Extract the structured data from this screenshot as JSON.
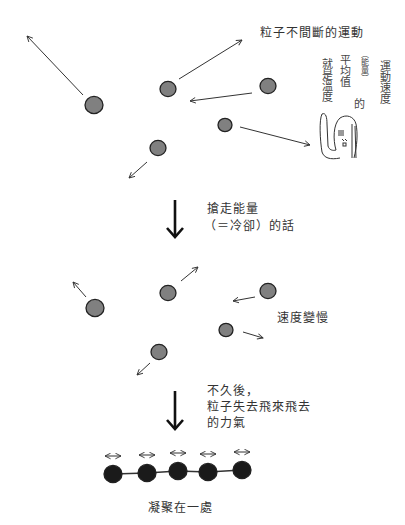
{
  "title": "粒子不間斷的運動",
  "sections": {
    "moving": {
      "label": "粒子不間斷的運動",
      "particles": [
        {
          "cx": 94,
          "cy": 105,
          "r": 9,
          "arrow": [
            83,
            95,
            27,
            36
          ]
        },
        {
          "cx": 168,
          "cy": 89,
          "r": 8,
          "arrow": [
            179,
            79,
            242,
            40
          ]
        },
        {
          "cx": 268,
          "cy": 86,
          "r": 8,
          "arrow": [
            252,
            93,
            190,
            101
          ]
        },
        {
          "cx": 225,
          "cy": 125,
          "r": 7,
          "arrow": [
            240,
            127,
            310,
            145
          ]
        },
        {
          "cx": 158,
          "cy": 148,
          "r": 8,
          "arrow": [
            147,
            162,
            129,
            178
          ]
        }
      ],
      "particle_color": "#808080"
    },
    "step1": {
      "arrow_label_line1": "搶走能量",
      "arrow_label_line2": "（＝冷卻）的話"
    },
    "slowing": {
      "label": "速度變慢",
      "particles": [
        {
          "cx": 95,
          "cy": 308,
          "r": 9,
          "arrow": [
            86,
            297,
            73,
            282
          ]
        },
        {
          "cx": 168,
          "cy": 293,
          "r": 8,
          "arrow": [
            181,
            281,
            198,
            267
          ]
        },
        {
          "cx": 268,
          "cy": 291,
          "r": 8,
          "arrow": [
            255,
            297,
            233,
            301
          ]
        },
        {
          "cx": 226,
          "cy": 330,
          "r": 7,
          "arrow": [
            243,
            332,
            263,
            338
          ]
        },
        {
          "cx": 159,
          "cy": 352,
          "r": 8,
          "arrow": [
            150,
            363,
            137,
            375
          ]
        }
      ],
      "particle_color": "#808080"
    },
    "step2": {
      "arrow_label_line1": "不久後，",
      "arrow_label_line2": "粒子失去飛來飛去",
      "arrow_label_line3": "的力氣"
    },
    "condensed": {
      "label": "凝聚在一處",
      "particles": [
        {
          "cx": 113,
          "cy": 474,
          "r": 9
        },
        {
          "cx": 147,
          "cy": 473,
          "r": 9
        },
        {
          "cx": 178,
          "cy": 471,
          "r": 9
        },
        {
          "cx": 208,
          "cy": 472,
          "r": 9
        },
        {
          "cx": 242,
          "cy": 470,
          "r": 9
        }
      ],
      "particle_color": "#1a1a1a"
    }
  },
  "annotation": {
    "columns": [
      "運動速度",
      "的",
      "（能量）",
      "平均值",
      "就是溫度"
    ],
    "character": "person-raising-hand"
  }
}
